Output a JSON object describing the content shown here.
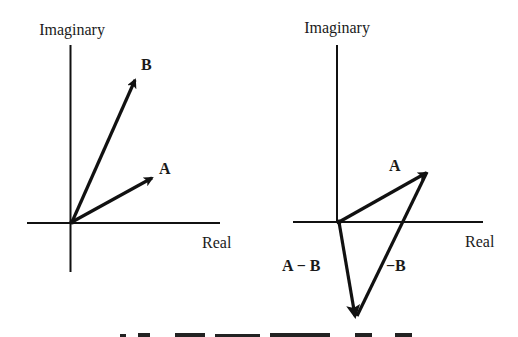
{
  "panels": [
    {
      "id": "left",
      "y_axis_label": "Imaginary",
      "x_axis_label": "Real",
      "vectors": [
        {
          "name": "B",
          "label": "B"
        },
        {
          "name": "A",
          "label": "A"
        }
      ]
    },
    {
      "id": "right",
      "y_axis_label": "Imaginary",
      "x_axis_label": "Real",
      "vectors": [
        {
          "name": "A",
          "label": "A"
        },
        {
          "name": "-B",
          "label": "−B"
        },
        {
          "name": "A-B",
          "label": "A − B"
        }
      ]
    }
  ],
  "colors": {
    "ink": "#111111",
    "background": "#ffffff"
  }
}
